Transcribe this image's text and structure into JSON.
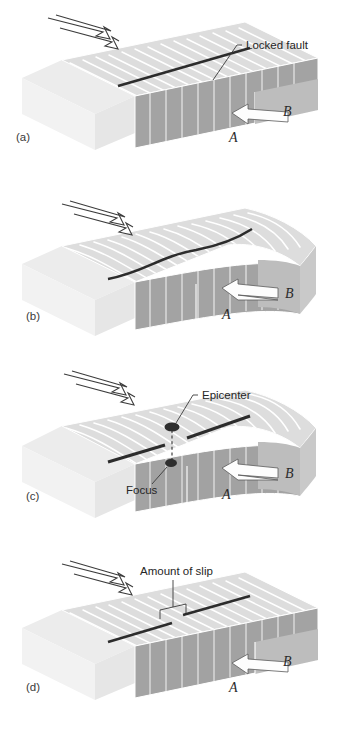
{
  "figure": {
    "background_color": "#ffffff",
    "width": 337,
    "height": 736
  },
  "palette": {
    "block_top_far": "#e9e9e9",
    "block_top_near": "#d6d6d6",
    "block_front_dark": "#9e9e9e",
    "block_front_mid": "#b5b5b5",
    "block_side_light": "#cfcfcf",
    "block_ghost": "#f1f1f1",
    "stratum_line": "#ffffff",
    "fault_line": "#2c2c2c",
    "arrow_fill": "#fdfdfd",
    "arrow_stroke": "#5a5a5a",
    "text_color": "#262626",
    "marker_color": "#2e2e2e"
  },
  "panels": [
    {
      "id": "a",
      "label": "(a)",
      "state": "Locked fault, no deformation",
      "strata_style": "straight",
      "fault_offset": false,
      "callouts": [
        {
          "name": "locked-fault",
          "text": "Locked fault"
        }
      ],
      "block_letters": [
        "A",
        "B"
      ],
      "stress_arrow": "down-right",
      "slip_arrow": "left"
    },
    {
      "id": "b",
      "label": "(b)",
      "state": "Strain accumulates, strata bend",
      "strata_style": "curved",
      "fault_offset": false,
      "callouts": [],
      "block_letters": [
        "A",
        "B"
      ],
      "stress_arrow": "down-right",
      "slip_arrow": "left"
    },
    {
      "id": "c",
      "label": "(c)",
      "state": "Rupture begins at focus, epicenter at surface",
      "strata_style": "curved",
      "fault_offset": false,
      "callouts": [
        {
          "name": "epicenter",
          "text": "Epicenter"
        },
        {
          "name": "focus",
          "text": "Focus"
        }
      ],
      "block_letters": [
        "A",
        "B"
      ],
      "stress_arrow": "down-right",
      "slip_arrow": "left"
    },
    {
      "id": "d",
      "label": "(d)",
      "state": "Elastic rebound, fault offset by slip",
      "strata_style": "straight",
      "fault_offset": true,
      "callouts": [
        {
          "name": "amount-of-slip",
          "text": "Amount of slip"
        }
      ],
      "block_letters": [
        "A",
        "B"
      ],
      "stress_arrow": "down-right",
      "slip_arrow": "left"
    }
  ],
  "labels": {
    "locked_fault": "Locked fault",
    "epicenter": "Epicenter",
    "focus": "Focus",
    "amount_of_slip": "Amount of slip",
    "block_a": "A",
    "block_b": "B",
    "panel_a": "(a)",
    "panel_b": "(b)",
    "panel_c": "(c)",
    "panel_d": "(d)"
  }
}
